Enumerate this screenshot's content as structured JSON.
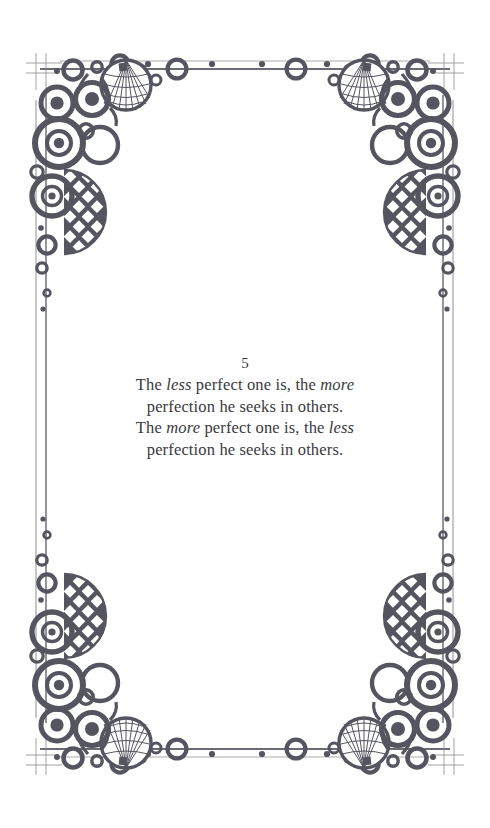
{
  "page": {
    "background_color": "#ffffff",
    "width": 490,
    "height": 828
  },
  "verse": {
    "number": "5",
    "text_color": "#3a3a3e",
    "lines": [
      [
        {
          "t": "The ",
          "i": false
        },
        {
          "t": "less",
          "i": true
        },
        {
          "t": " perfect one is, the ",
          "i": false
        },
        {
          "t": "more",
          "i": true
        }
      ],
      [
        {
          "t": "perfection he seeks in others.",
          "i": false
        }
      ],
      [
        {
          "t": "The ",
          "i": false
        },
        {
          "t": "more",
          "i": true
        },
        {
          "t": " perfect one is, the ",
          "i": false
        },
        {
          "t": "less",
          "i": true
        }
      ],
      [
        {
          "t": "perfection he seeks in others.",
          "i": false
        }
      ]
    ],
    "plain_lines": [
      "The less perfect one is, the more",
      "perfection he seeks in others.",
      "The more perfect one is, the less",
      "perfection he seeks in others."
    ]
  },
  "border": {
    "ink_color": "#555560",
    "rule_color": "#6e6e78",
    "frame": {
      "left": 36,
      "right": 453,
      "top": 63,
      "bottom": 755,
      "inner_offset": 10
    },
    "horizontal_rule_marks": {
      "rings": [
        177,
        296
      ],
      "dots": [
        148,
        212,
        262,
        327,
        380
      ]
    },
    "ornament_name": "art-deco-corner-ornament",
    "corners": [
      "top-left",
      "top-right",
      "bottom-left",
      "bottom-right"
    ]
  }
}
